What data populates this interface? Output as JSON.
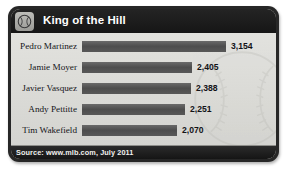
{
  "header": {
    "title": "King of the Hill",
    "icon": "baseball-icon"
  },
  "footer": {
    "source": "Source: www.mlb.com, July 2011"
  },
  "colors": {
    "card_border": "#272727",
    "header_bg": "#1d1d1d",
    "plot_bg": "#dcdcd8",
    "bar": "#565656",
    "title_text": "#ffffff",
    "label_text": "#15151a",
    "footer_bg": "#202020",
    "footer_text": "#f0f0ee"
  },
  "chart_data": {
    "type": "bar",
    "orientation": "horizontal",
    "title": "King of the Hill",
    "xlabel": "",
    "ylabel": "",
    "grid": false,
    "legend": false,
    "source": "Source: www.mlb.com, July 2011",
    "categories": [
      "Pedro Martinez",
      "Jamie Moyer",
      "Javier Vasquez",
      "Andy Pettitte",
      "Tim Wakefield"
    ],
    "values": [
      3154,
      2405,
      2388,
      2251,
      2070
    ],
    "value_labels": [
      "3,154",
      "2,405",
      "2,388",
      "2,251",
      "2,070"
    ],
    "xlim": [
      0,
      3154
    ],
    "bars": [
      {
        "label": "Pedro Martinez",
        "value": 3154,
        "value_label": "3,154",
        "width_px": 144
      },
      {
        "label": "Jamie Moyer",
        "value": 2405,
        "value_label": "2,405",
        "width_px": 110
      },
      {
        "label": "Javier Vasquez",
        "value": 2388,
        "value_label": "2,388",
        "width_px": 109
      },
      {
        "label": "Andy Pettitte",
        "value": 2251,
        "value_label": "2,251",
        "width_px": 103
      },
      {
        "label": "Tim Wakefield",
        "value": 2070,
        "value_label": "2,070",
        "width_px": 95
      }
    ]
  }
}
